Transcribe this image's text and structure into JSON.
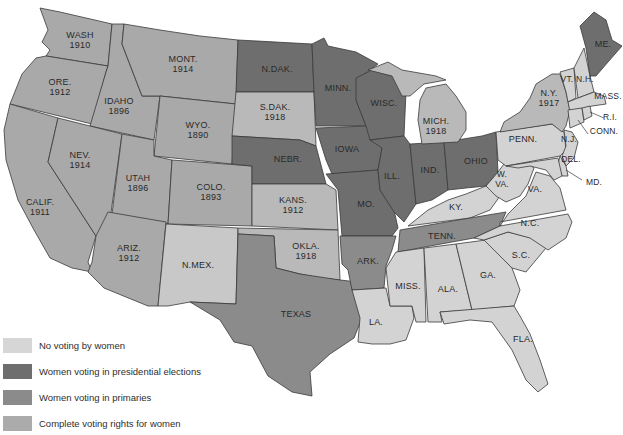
{
  "colors": {
    "none": "#d3d3d3",
    "presidential": "#6e6e6e",
    "primaries": "#8b8b8b",
    "complete": "#a9a9a9",
    "complete_light": "#b9b9b9",
    "background": "#ffffff"
  },
  "legend": {
    "items": [
      {
        "key": "none",
        "label": "No voting by women"
      },
      {
        "key": "presidential",
        "label": "Women voting in presidential elections"
      },
      {
        "key": "primaries",
        "label": "Women voting in primaries"
      },
      {
        "key": "complete",
        "label": "Complete voting rights for women"
      }
    ]
  },
  "states": {
    "wash": {
      "name": "WASH",
      "year": "1910",
      "category": "complete"
    },
    "ore": {
      "name": "ORE.",
      "year": "1912",
      "category": "complete"
    },
    "calif": {
      "name": "CALIF.",
      "year": "1911",
      "category": "complete"
    },
    "idaho": {
      "name": "IDAHO",
      "year": "1896",
      "category": "complete"
    },
    "nev": {
      "name": "NEV.",
      "year": "1914",
      "category": "complete"
    },
    "mont": {
      "name": "MONT.",
      "year": "1914",
      "category": "complete"
    },
    "wyo": {
      "name": "WYO.",
      "year": "1890",
      "category": "complete"
    },
    "utah": {
      "name": "UTAH",
      "year": "1896",
      "category": "complete"
    },
    "colo": {
      "name": "COLO.",
      "year": "1893",
      "category": "complete"
    },
    "ariz": {
      "name": "ARIZ.",
      "year": "1912",
      "category": "complete"
    },
    "nmex": {
      "name": "N.MEX.",
      "year": "",
      "category": "none"
    },
    "ndak": {
      "name": "N.DAK.",
      "year": "",
      "category": "presidential"
    },
    "sdak": {
      "name": "S.DAK.",
      "year": "1918",
      "category": "complete"
    },
    "nebr": {
      "name": "NEBR.",
      "year": "",
      "category": "presidential"
    },
    "kans": {
      "name": "KANS.",
      "year": "1912",
      "category": "complete"
    },
    "okla": {
      "name": "OKLA.",
      "year": "1918",
      "category": "complete"
    },
    "texas": {
      "name": "TEXAS",
      "year": "",
      "category": "primaries"
    },
    "minn": {
      "name": "MINN.",
      "year": "",
      "category": "presidential"
    },
    "iowa": {
      "name": "IOWA",
      "year": "",
      "category": "presidential"
    },
    "mo": {
      "name": "MO.",
      "year": "",
      "category": "presidential"
    },
    "ark": {
      "name": "ARK.",
      "year": "",
      "category": "primaries"
    },
    "la": {
      "name": "LA.",
      "year": "",
      "category": "none"
    },
    "wisc": {
      "name": "WISC.",
      "year": "",
      "category": "presidential"
    },
    "ill": {
      "name": "ILL.",
      "year": "",
      "category": "presidential"
    },
    "mich": {
      "name": "MICH.",
      "year": "1918",
      "category": "complete"
    },
    "ind": {
      "name": "IND.",
      "year": "",
      "category": "presidential"
    },
    "ohio": {
      "name": "OHIO",
      "year": "",
      "category": "presidential"
    },
    "ky": {
      "name": "KY.",
      "year": "",
      "category": "none"
    },
    "tenn": {
      "name": "TENN.",
      "year": "",
      "category": "primaries"
    },
    "miss": {
      "name": "MISS.",
      "year": "",
      "category": "none"
    },
    "ala": {
      "name": "ALA.",
      "year": "",
      "category": "none"
    },
    "ga": {
      "name": "GA.",
      "year": "",
      "category": "none"
    },
    "fla": {
      "name": "FLA.",
      "year": "",
      "category": "none"
    },
    "sc": {
      "name": "S.C.",
      "year": "",
      "category": "none"
    },
    "nc": {
      "name": "N.C.",
      "year": "",
      "category": "none"
    },
    "va": {
      "name": "VA.",
      "year": "",
      "category": "none"
    },
    "wva_1": {
      "name": "W.",
      "year": "",
      "category": "none"
    },
    "wva_2": {
      "name": "VA.",
      "year": "",
      "category": "none"
    },
    "penn": {
      "name": "PENN.",
      "year": "",
      "category": "none"
    },
    "ny": {
      "name": "N.Y.",
      "year": "1917",
      "category": "complete"
    },
    "nj": {
      "name": "N.J.",
      "year": "",
      "category": "none"
    },
    "del": {
      "name": "DEL.",
      "year": "",
      "category": "none"
    },
    "md": {
      "name": "MD.",
      "year": "",
      "category": "none"
    },
    "vt": {
      "name": "VT.",
      "year": "",
      "category": "none"
    },
    "nh": {
      "name": "N.H.",
      "year": "",
      "category": "none"
    },
    "me": {
      "name": "ME.",
      "year": "",
      "category": "presidential"
    },
    "mass": {
      "name": "MASS.",
      "year": "",
      "category": "none"
    },
    "ri": {
      "name": "R.I.",
      "year": "",
      "category": "none"
    },
    "conn": {
      "name": "CONN.",
      "year": "",
      "category": "none"
    }
  }
}
